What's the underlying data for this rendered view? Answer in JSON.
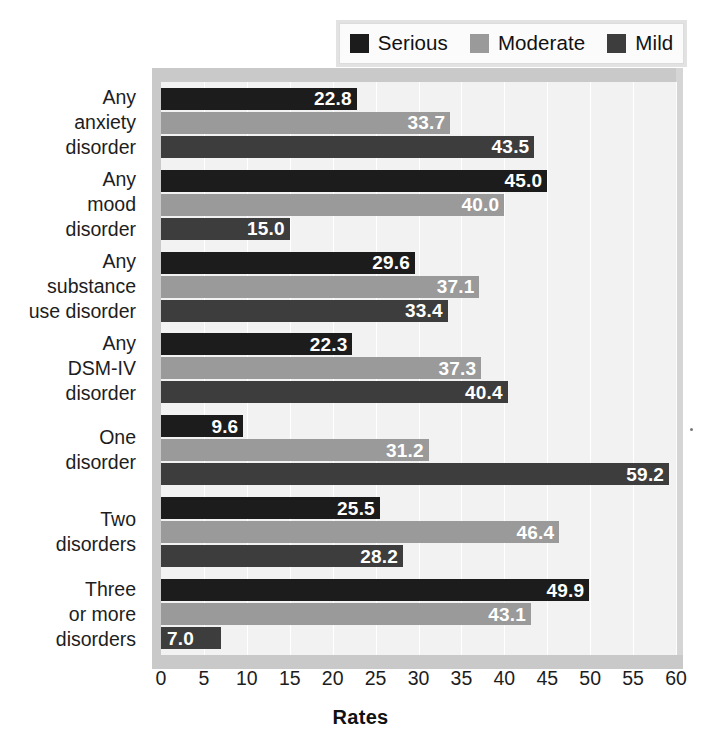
{
  "legend": {
    "position": "top-right",
    "items": [
      {
        "label": "Serious",
        "color": "#1c1c1c",
        "icon": "legend-swatch-icon"
      },
      {
        "label": "Moderate",
        "color": "#9a9a9a",
        "icon": "legend-swatch-icon"
      },
      {
        "label": "Mild",
        "color": "#3d3d3d",
        "icon": "legend-swatch-icon"
      }
    ]
  },
  "axis": {
    "xlabel": "Rates",
    "ticks": [
      "0",
      "5",
      "10",
      "15",
      "20",
      "25",
      "30",
      "35",
      "40",
      "45",
      "50",
      "55",
      "60"
    ]
  },
  "categories": [
    {
      "lines": [
        "Any",
        "anxiety",
        "disorder"
      ]
    },
    {
      "lines": [
        "Any",
        "mood",
        "disorder"
      ]
    },
    {
      "lines": [
        "Any",
        "substance",
        "use disorder"
      ]
    },
    {
      "lines": [
        "Any",
        "DSM-IV",
        "disorder"
      ]
    },
    {
      "lines": [
        "One",
        "disorder"
      ]
    },
    {
      "lines": [
        "Two",
        "disorders"
      ]
    },
    {
      "lines": [
        "Three",
        "or more",
        "disorders"
      ]
    }
  ],
  "chart_data": {
    "type": "bar",
    "orientation": "horizontal",
    "title": "",
    "xlabel": "Rates",
    "ylabel": "",
    "xlim": [
      0,
      60
    ],
    "xticks": [
      0,
      5,
      10,
      15,
      20,
      25,
      30,
      35,
      40,
      45,
      50,
      55,
      60
    ],
    "grid": true,
    "legend_position": "top-right",
    "categories": [
      "Any anxiety disorder",
      "Any mood disorder",
      "Any substance use disorder",
      "Any DSM-IV disorder",
      "One disorder",
      "Two disorders",
      "Three or more disorders"
    ],
    "series": [
      {
        "name": "Serious",
        "color": "#1c1c1c",
        "values": [
          22.8,
          45.0,
          29.6,
          22.3,
          9.6,
          25.5,
          49.9
        ],
        "labels": [
          "22.8",
          "45.0",
          "29.6",
          "22.3",
          "9.6",
          "25.5",
          "49.9"
        ]
      },
      {
        "name": "Moderate",
        "color": "#9a9a9a",
        "values": [
          33.7,
          40.0,
          37.1,
          37.3,
          31.2,
          46.4,
          43.1
        ],
        "labels": [
          "33.7",
          "40.0",
          "37.1",
          "37.3",
          "31.2",
          "46.4",
          "43.1"
        ]
      },
      {
        "name": "Mild",
        "color": "#3d3d3d",
        "values": [
          43.5,
          15.0,
          33.4,
          40.4,
          59.2,
          28.2,
          7.0
        ],
        "labels": [
          "43.5",
          "15.0",
          "33.4",
          "40.4",
          "59.2",
          "28.2",
          "7.0"
        ]
      }
    ]
  }
}
